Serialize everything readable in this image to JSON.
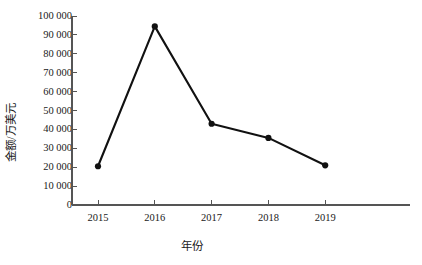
{
  "chart_data": {
    "type": "line",
    "title": "",
    "xlabel": "年份",
    "ylabel": "金额/万美元",
    "categories": [
      "2015",
      "2016",
      "2017",
      "2018",
      "2019"
    ],
    "x": [
      2015,
      2016,
      2017,
      2018,
      2019
    ],
    "values": [
      20500,
      94500,
      43000,
      35500,
      21000
    ],
    "series": [
      {
        "name": "金额",
        "values": [
          20500,
          94500,
          43000,
          35500,
          21000
        ]
      }
    ],
    "ylim": [
      0,
      100000
    ],
    "ytick_values": [
      0,
      10000,
      20000,
      30000,
      40000,
      50000,
      60000,
      70000,
      80000,
      90000,
      100000
    ],
    "ytick_labels": [
      "0",
      "10 000",
      "20 000",
      "30 000",
      "40 000",
      "50 000",
      "60 000",
      "70 000",
      "80 000",
      "90 000",
      "100 000"
    ],
    "xtick_labels": [
      "2015",
      "2016",
      "2017",
      "2018",
      "2019"
    ],
    "grid": false,
    "legend": false,
    "legend_position": "none",
    "marker": "filled-circle",
    "line_color": "#111111",
    "marker_color": "#111111",
    "axis_color": "#555555",
    "background_color": "#ffffff",
    "annotations": []
  }
}
